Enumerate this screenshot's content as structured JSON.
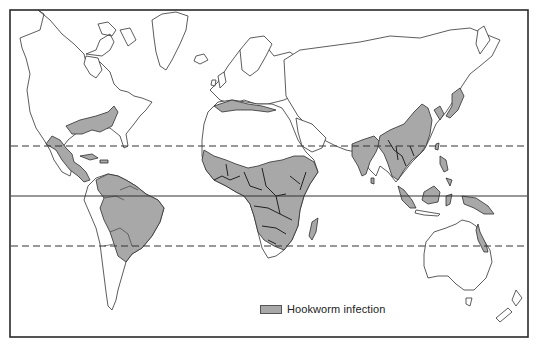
{
  "map": {
    "title": "Hookworm infection distribution",
    "frame": {
      "x": 10,
      "y": 10,
      "width": 518,
      "height": 327
    },
    "reference_lines": [
      {
        "name": "tropic-of-cancer",
        "y": 146,
        "style": "dashed"
      },
      {
        "name": "equator",
        "y": 196,
        "style": "solid"
      },
      {
        "name": "tropic-of-capricorn",
        "y": 246,
        "style": "dashed"
      }
    ],
    "colors": {
      "infected_fill": "#a8a8a8",
      "land_fill": "#ffffff",
      "outline": "#333333",
      "background": "#ffffff"
    },
    "infected_regions": [
      "Southeastern United States",
      "Mexico and Central America",
      "Caribbean",
      "Northern and central South America",
      "Sub-Saharan Africa",
      "Madagascar",
      "North Africa Mediterranean coast",
      "Southern Europe coast",
      "Indian subcontinent",
      "Southern and eastern China",
      "Southeast Asia",
      "Korea and Japan",
      "Indonesia and Philippines",
      "New Guinea",
      "Northeastern Australia"
    ]
  },
  "legend": {
    "label": "Hookworm infection",
    "swatch_color": "#a8a8a8"
  }
}
